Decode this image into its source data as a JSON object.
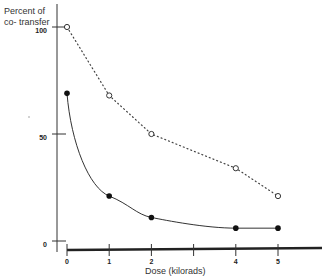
{
  "chart_data": {
    "type": "line",
    "title": "",
    "ylabel": "Percent of co- transfer",
    "ylabel_lines": [
      "Percent of",
      "co- transfer"
    ],
    "xlabel": "Dose   (kilorads)",
    "xlim": [
      0,
      5
    ],
    "ylim": [
      0,
      100
    ],
    "x_ticks": [
      0,
      1,
      2,
      3,
      4,
      5
    ],
    "x_tick_labels": [
      "0",
      "1",
      "2",
      "",
      "4",
      "5"
    ],
    "y_ticks": [
      0,
      50,
      100
    ],
    "y_tick_labels": [
      "0",
      "50",
      "100"
    ],
    "grid": false,
    "legend": null,
    "x": [
      0,
      1,
      2,
      4,
      5
    ],
    "series": [
      {
        "name": "open circles (dotted)",
        "marker": "open-circle",
        "line": "dotted",
        "values": [
          100,
          68,
          50,
          34,
          21
        ]
      },
      {
        "name": "filled circles (solid curve)",
        "marker": "filled-circle",
        "line": "solid",
        "values": [
          69,
          21,
          11,
          6,
          6
        ]
      }
    ]
  }
}
